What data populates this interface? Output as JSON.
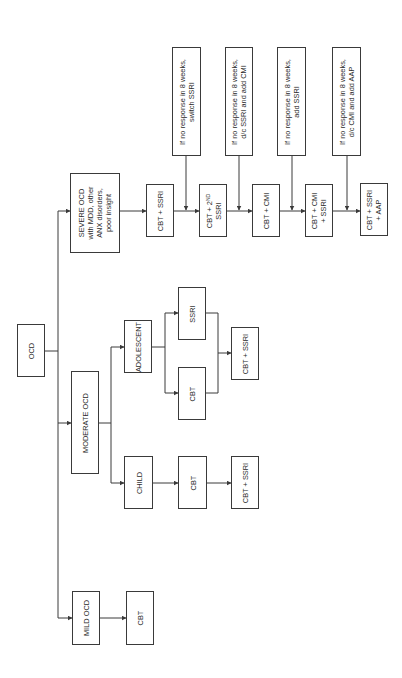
{
  "diagram": {
    "orientation": "rotated-90-ccw",
    "root": {
      "id": "ocd",
      "label": "OCD"
    },
    "branches": [
      {
        "id": "mild",
        "label": "MILD OCD",
        "steps": [
          {
            "id": "mild-cbt",
            "label": "CBT"
          }
        ]
      },
      {
        "id": "moderate",
        "label": "MODERATE OCD",
        "sub": [
          {
            "id": "child",
            "label": "CHILD",
            "steps": [
              {
                "id": "child-cbt",
                "label": "CBT"
              },
              {
                "id": "child-cbt-ssri",
                "label": "CBT + SSRI"
              }
            ]
          },
          {
            "id": "adolescent",
            "label": "ADOLESCENT",
            "options": [
              {
                "id": "adol-cbt",
                "label": "CBT"
              },
              {
                "id": "adol-ssri",
                "label": "SSRI"
              }
            ],
            "merge": {
              "id": "adol-cbt-ssri",
              "label": "CBT + SSRI"
            }
          }
        ]
      },
      {
        "id": "severe",
        "label_lines": [
          "SEVERE OCD",
          "with MDD, other",
          "ANX disorders,",
          "poor insight"
        ],
        "steps": [
          {
            "id": "sev-1",
            "label_lines": [
              "CBT + SSRI"
            ]
          },
          {
            "id": "sev-2",
            "label_main": "CBT + 2",
            "label_sub": "ND",
            "label_line2": "SSRI"
          },
          {
            "id": "sev-3",
            "label_lines": [
              "CBT + CMI"
            ]
          },
          {
            "id": "sev-4",
            "label_lines": [
              "CBT + CMI",
              "+ SSRI"
            ]
          },
          {
            "id": "sev-5",
            "label_lines": [
              "CBT + SSRI",
              "+ AAP"
            ]
          }
        ],
        "notes": [
          {
            "id": "note-1",
            "label_lines": [
              "If no response in 8 weeks,",
              "switch SSRI"
            ]
          },
          {
            "id": "note-2",
            "label_lines": [
              "If no response in 8 weeks,",
              "d/c SSRI and add CMI"
            ]
          },
          {
            "id": "note-3",
            "label_lines": [
              "If no response in 8 weeks,",
              "add SSRI"
            ]
          },
          {
            "id": "note-4",
            "label_lines": [
              "If no response in 8 weeks,",
              "d/c CMI and add AAP"
            ]
          }
        ]
      }
    ]
  },
  "colors": {
    "line": "#3a3a3a",
    "text": "#2a2a2a",
    "background": "#ffffff"
  }
}
